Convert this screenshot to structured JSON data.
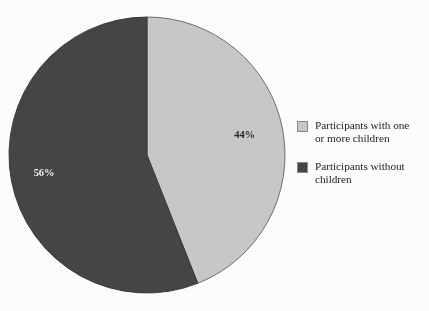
{
  "chart_data": {
    "type": "pie",
    "title": "",
    "categories": [
      "Participants with one or more children",
      "Participants without children"
    ],
    "values": [
      44,
      56
    ],
    "value_labels": [
      "44%",
      "56%"
    ],
    "colors": [
      "#c8c8c8",
      "#454545"
    ],
    "start_angle_deg": 0,
    "direction": "clockwise",
    "legend_position": "right",
    "grid": false,
    "slices": [
      {
        "label": "Participants with one or more children",
        "legend_line_1": "Participants with one",
        "legend_line_2": "or more children",
        "value": 44,
        "value_label": "44%",
        "color": "#c8c8c8",
        "label_text_color": "#2a2a2a"
      },
      {
        "label": "Participants without children",
        "legend_line_1": "Participants without",
        "legend_line_2": "children",
        "value": 56,
        "value_label": "56%",
        "color": "#454545",
        "label_text_color": "#f2f2f2"
      }
    ]
  }
}
